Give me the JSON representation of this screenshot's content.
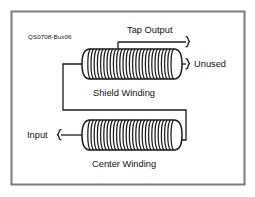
{
  "diagram": {
    "id_label": "QS0708-Bux06",
    "border_color": "#7d7d7d",
    "line_color": "#1a1a1a",
    "background": "#ffffff",
    "labels": {
      "tap_output": "Tap Output",
      "unused": "Unused",
      "input": "Input",
      "shield_winding": "Shield Winding",
      "center_winding": "Center Winding"
    },
    "windings": [
      {
        "name": "shield-winding",
        "caption": "Shield Winding",
        "turns": 26,
        "x": 86,
        "y": 49,
        "width": 92,
        "height": 30
      },
      {
        "name": "center-winding",
        "caption": "Center Winding",
        "turns": 26,
        "x": 86,
        "y": 120,
        "width": 92,
        "height": 30
      }
    ],
    "terminals": [
      {
        "name": "tap-output",
        "label": "Tap Output",
        "side": "top"
      },
      {
        "name": "unused",
        "label": "Unused",
        "side": "right"
      },
      {
        "name": "input",
        "label": "Input",
        "side": "left"
      }
    ]
  }
}
